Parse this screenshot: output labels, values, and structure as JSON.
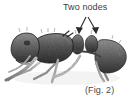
{
  "figure": {
    "kind": "scientific-illustration",
    "annotation_label": "Two nodes",
    "caption": "(Fig. 2)",
    "background_color": "#ffffff",
    "ink_color": "#3d3d3d",
    "arrow_color": "#2b2b2b",
    "annotation_target": "petiole and postpetiole nodes",
    "arrows": [
      {
        "name": "arrow-left-node",
        "from_x": 86,
        "from_y": 16,
        "to_x": 79,
        "to_y": 33
      },
      {
        "name": "arrow-right-node",
        "from_x": 88,
        "from_y": 16,
        "to_x": 96,
        "to_y": 33
      }
    ],
    "body_parts": [
      {
        "name": "head",
        "label": "head"
      },
      {
        "name": "mesosoma",
        "label": "mesosoma"
      },
      {
        "name": "petiole-node",
        "label": "petiole node"
      },
      {
        "name": "postpetiole-node",
        "label": "postpetiole node"
      },
      {
        "name": "gaster",
        "label": "gaster"
      },
      {
        "name": "legs",
        "label": "legs"
      },
      {
        "name": "antenna",
        "label": "antenna"
      }
    ]
  }
}
